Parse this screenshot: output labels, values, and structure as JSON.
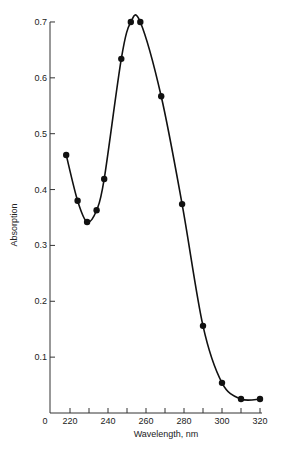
{
  "chart_data": {
    "type": "line",
    "title": "",
    "xlabel": "Wavelength, nm",
    "ylabel": "Absorption",
    "xlim": [
      210,
      322
    ],
    "ylim": [
      0,
      0.7
    ],
    "x_ticks": [
      220,
      240,
      260,
      280,
      300,
      320
    ],
    "x_minor_ticks": [
      220,
      230,
      240,
      250,
      260,
      270,
      280,
      290,
      300,
      310,
      320
    ],
    "x_origin_label": "0",
    "y_ticks": [
      0.1,
      0.2,
      0.3,
      0.4,
      0.5,
      0.6,
      0.7
    ],
    "y_tick_labels": [
      "0.1",
      "0.2",
      "0.3",
      "0.4",
      "0.5",
      "0.6",
      "0.7"
    ],
    "grid": false,
    "legend": null,
    "series": [
      {
        "name": "Absorption spectrum",
        "x": [
          218,
          224,
          229,
          234,
          238,
          247,
          252,
          257,
          268,
          279,
          290,
          300,
          310,
          320
        ],
        "values": [
          0.462,
          0.38,
          0.342,
          0.363,
          0.419,
          0.634,
          0.7,
          0.7,
          0.567,
          0.374,
          0.156,
          0.054,
          0.025,
          0.025
        ]
      }
    ]
  }
}
